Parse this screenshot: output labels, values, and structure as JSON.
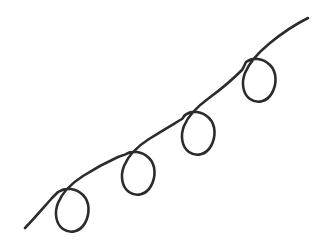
{
  "image": {
    "title": "Looping spiral curve",
    "description": "Hand-drawn continuous line ascending from lower-left to upper-right with four hanging loops",
    "width": 324,
    "height": 247,
    "background_color": "#ffffff"
  },
  "drawing": {
    "stroke_color": "#2b2b2b",
    "stroke_width": 2.6,
    "stroke_linecap": "round",
    "stroke_linejoin": "round",
    "fill": "none",
    "viewbox": "0 0 324 247",
    "path_name": "looping-curve",
    "path_d": "M 25 228 C 34 219 44 207 52 198 C 55 195 57 193 58 192 C 66 187 76 188 83 195 C 90 202 90 214 85 223 C 80 232 70 234 63 229 C 56 224 54 213 58 203 C 62 193 72 183 83 176 C 94 169 107 162 118 157 C 121 156 123 155 124 155 C 132 150 142 151 149 158 C 156 165 156 177 151 186 C 146 195 136 197 129 192 C 122 187 120 176 124 166 C 128 156 138 146 149 139 C 160 132 172 125 182 119 C 183 118 184 116 185 115 C 192 110 202 111 209 118 C 216 125 216 137 211 146 C 206 155 196 157 189 152 C 182 147 180 136 184 126 C 188 116 198 106 209 98 C 220 90 232 80 242 70 C 244 67 245 64 246 62 C 253 57 263 58 270 65 C 277 72 277 84 272 93 C 267 102 257 104 250 99 C 243 94 241 83 245 73 C 249 63 259 52 270 43 C 281 34 294 25 308 18",
    "segments": [
      {
        "name": "start-tail",
        "from": [
          25,
          228
        ],
        "to": [
          58,
          192
        ]
      },
      {
        "name": "loop-1",
        "crossing": [
          58,
          192
        ],
        "bounds": [
          55,
          190,
          88,
          232
        ]
      },
      {
        "name": "arc-1-to-2",
        "from": [
          58,
          192
        ],
        "to": [
          124,
          155
        ]
      },
      {
        "name": "loop-2",
        "crossing": [
          124,
          155
        ],
        "bounds": [
          117,
          152,
          152,
          195
        ]
      },
      {
        "name": "arc-2-to-3",
        "from": [
          124,
          155
        ],
        "to": [
          184,
          115
        ]
      },
      {
        "name": "loop-3",
        "crossing": [
          184,
          115
        ],
        "bounds": [
          178,
          112,
          213,
          155
        ]
      },
      {
        "name": "arc-3-to-4",
        "from": [
          184,
          115
        ],
        "to": [
          246,
          62
        ]
      },
      {
        "name": "loop-4",
        "crossing": [
          246,
          62
        ],
        "bounds": [
          240,
          58,
          275,
          102
        ]
      },
      {
        "name": "end-tail",
        "from": [
          246,
          62
        ],
        "to": [
          308,
          18
        ]
      }
    ],
    "loop_count": 4
  }
}
